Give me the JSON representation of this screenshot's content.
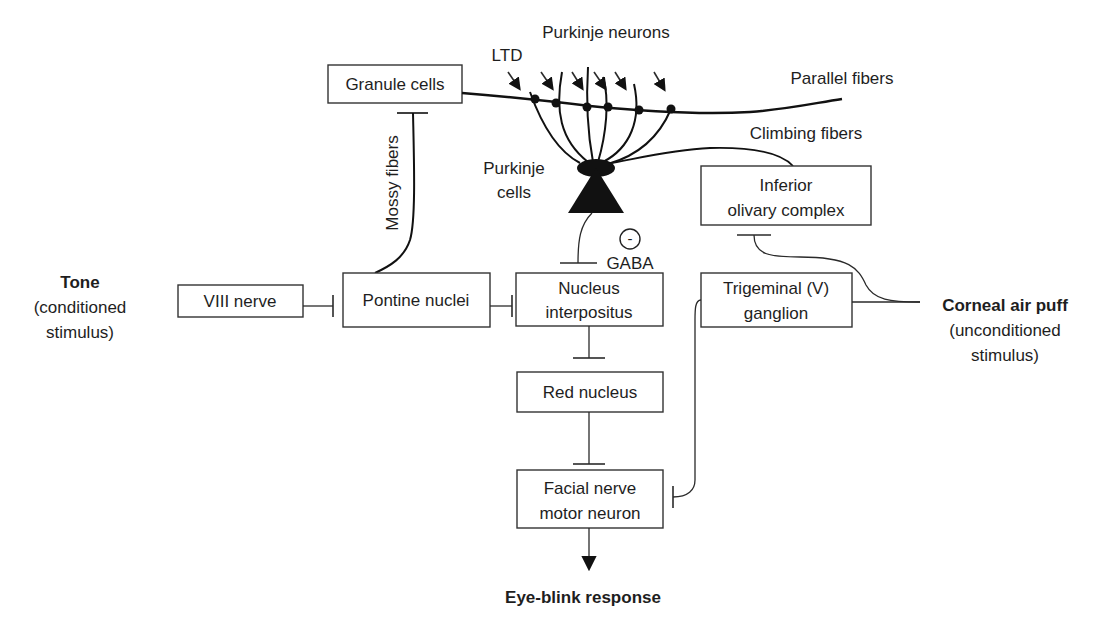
{
  "diagram": {
    "title_labels": {
      "purkinje_neurons": "Purkinje neurons",
      "ltd": "LTD",
      "parallel_fibers": "Parallel fibers",
      "climbing_fibers": "Climbing fibers",
      "mossy_fibers": "Mossy fibers",
      "purkinje_cells_line1": "Purkinje",
      "purkinje_cells_line2": "cells",
      "gaba": "GABA",
      "inhibition_symbol": "-"
    },
    "nodes": {
      "granule_cells": "Granule cells",
      "viii_nerve": "VIII nerve",
      "pontine_nuclei": "Pontine nuclei",
      "nucleus_interpositus_line1": "Nucleus",
      "nucleus_interpositus_line2": "interpositus",
      "red_nucleus": "Red nucleus",
      "facial_nerve_line1": "Facial nerve",
      "facial_nerve_line2": "motor neuron",
      "inferior_olivary_line1": "Inferior",
      "inferior_olivary_line2": "olivary complex",
      "trigeminal_line1": "Trigeminal (V)",
      "trigeminal_line2": "ganglion"
    },
    "stimuli": {
      "tone": "Tone",
      "tone_sub1": "(conditioned",
      "tone_sub2": "stimulus)",
      "air_puff": "Corneal air puff",
      "air_puff_sub1": "(unconditioned",
      "air_puff_sub2": "stimulus)"
    },
    "output": {
      "response": "Eye-blink response"
    }
  }
}
